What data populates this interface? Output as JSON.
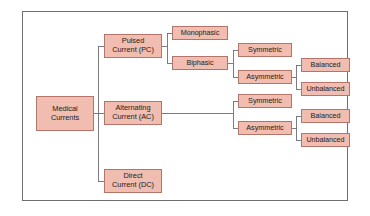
{
  "diagram": {
    "type": "hierarchy-tree",
    "colors": {
      "node_fill": "#f0bdb0",
      "node_border": "#b5746a",
      "connector": "#6e6e72",
      "frame_border": "#6e6e72",
      "background": "#ffffff",
      "text": "#1c1c1c"
    },
    "root": {
      "id": "medical-currents",
      "label": "Medical\nCurrents"
    },
    "level1": [
      {
        "id": "pulsed-current",
        "label": "Pulsed\nCurrent (PC)"
      },
      {
        "id": "alternating-current",
        "label": "Alternating\nCurrent (AC)"
      },
      {
        "id": "direct-current",
        "label": "Direct\nCurrent (DC)"
      }
    ],
    "level2": [
      {
        "id": "monophasic",
        "label": "Monophasic",
        "parent": "pulsed-current"
      },
      {
        "id": "biphasic",
        "label": "Biphasic",
        "parent": "pulsed-current"
      }
    ],
    "level3": [
      {
        "id": "pc-symmetric",
        "label": "Symmetric",
        "parent": "biphasic"
      },
      {
        "id": "pc-asymmetric",
        "label": "Asymmetric",
        "parent": "biphasic"
      },
      {
        "id": "ac-symmetric",
        "label": "Symmetric",
        "parent": "alternating-current"
      },
      {
        "id": "ac-asymmetric",
        "label": "Asymmetric",
        "parent": "alternating-current"
      }
    ],
    "level4": [
      {
        "id": "pc-balanced",
        "label": "Balanced",
        "parent": "pc-asymmetric"
      },
      {
        "id": "pc-unbalanced",
        "label": "Unbalanced",
        "parent": "pc-asymmetric"
      },
      {
        "id": "ac-balanced",
        "label": "Balanced",
        "parent": "ac-asymmetric"
      },
      {
        "id": "ac-unbalanced",
        "label": "Unbalanced",
        "parent": "ac-asymmetric"
      }
    ]
  }
}
